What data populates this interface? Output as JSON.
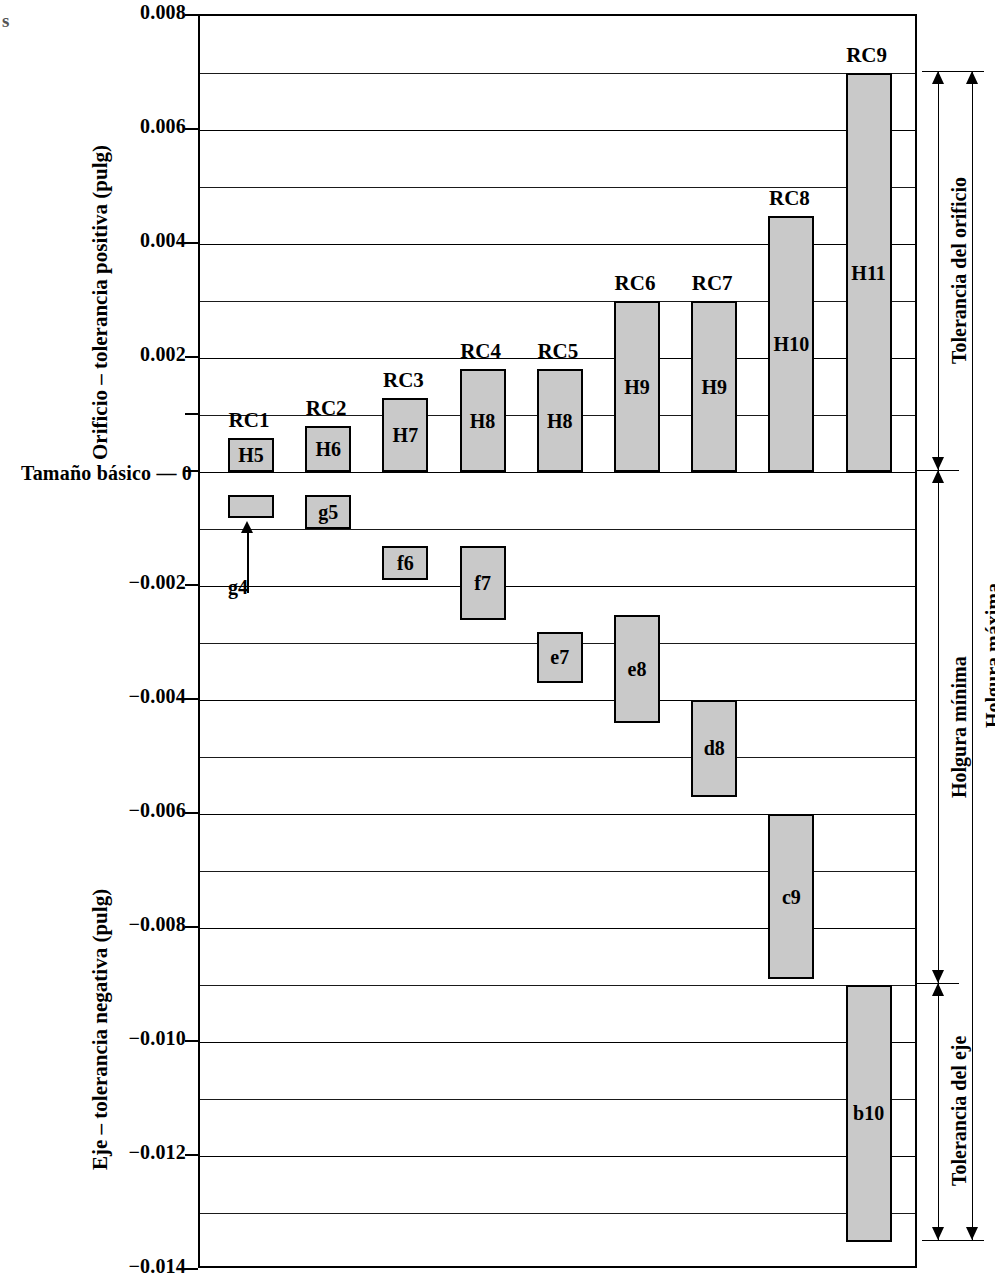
{
  "chart_data": {
    "type": "bar",
    "title": "",
    "ylabel_positive": "Orificio – tolerancia positiva (pulg)",
    "ylabel_negative": "Eje – tolerancia negativa (pulg)",
    "zero_label": "Tamaño básico — 0",
    "xlabel": "",
    "ylim": [
      -0.014,
      0.008
    ],
    "grid": true,
    "gridline_step": 0.001,
    "tick_labels": [
      "0.008",
      "0.006",
      "0.004",
      "0.002",
      "0",
      "-0.002",
      "-0.004",
      "-0.006",
      "-0.008",
      "-0.010",
      "-0.012",
      "-0.014"
    ],
    "tick_values": [
      0.008,
      0.006,
      0.004,
      0.002,
      0.0,
      -0.002,
      -0.004,
      -0.006,
      -0.008,
      -0.01,
      -0.012,
      -0.014
    ],
    "units": "pulg",
    "legend_position": "none",
    "groups": [
      {
        "name": "RC1",
        "hole": {
          "label": "H5",
          "low": 0.0,
          "high": 0.0006
        },
        "shaft": {
          "label": "g4",
          "low": -0.0008,
          "high": -0.0004
        }
      },
      {
        "name": "RC2",
        "hole": {
          "label": "H6",
          "low": 0.0,
          "high": 0.0008
        },
        "shaft": {
          "label": "g5",
          "low": -0.001,
          "high": -0.0004
        }
      },
      {
        "name": "RC3",
        "hole": {
          "label": "H7",
          "low": 0.0,
          "high": 0.0013
        },
        "shaft": {
          "label": "f6",
          "low": -0.0019,
          "high": -0.0013
        }
      },
      {
        "name": "RC4",
        "hole": {
          "label": "H8",
          "low": 0.0,
          "high": 0.0018
        },
        "shaft": {
          "label": "f7",
          "low": -0.0026,
          "high": -0.0013
        }
      },
      {
        "name": "RC5",
        "hole": {
          "label": "H8",
          "low": 0.0,
          "high": 0.0018
        },
        "shaft": {
          "label": "e7",
          "low": -0.0037,
          "high": -0.0028
        }
      },
      {
        "name": "RC6",
        "hole": {
          "label": "H9",
          "low": 0.0,
          "high": 0.003
        },
        "shaft": {
          "label": "e8",
          "low": -0.0044,
          "high": -0.0025
        }
      },
      {
        "name": "RC7",
        "hole": {
          "label": "H9",
          "low": 0.0,
          "high": 0.003
        },
        "shaft": {
          "label": "d8",
          "low": -0.0057,
          "high": -0.004
        }
      },
      {
        "name": "RC8",
        "hole": {
          "label": "H10",
          "low": 0.0,
          "high": 0.0045
        },
        "shaft": {
          "label": "c9",
          "low": -0.0089,
          "high": -0.006
        }
      },
      {
        "name": "RC9",
        "hole": {
          "label": "H11",
          "low": 0.0,
          "high": 0.007
        },
        "shaft": {
          "label": "b10",
          "low": -0.0135,
          "high": -0.009
        }
      }
    ]
  },
  "annotations": {
    "hole_tolerance": "Tolerancia del orificio",
    "shaft_tolerance": "Tolerancia del eje",
    "min_clearance": "Holgura mínima",
    "max_clearance": "Holgura máxima"
  },
  "callout": {
    "g4_label": "g4"
  },
  "margin_artifact": {
    "left_text": "s"
  }
}
